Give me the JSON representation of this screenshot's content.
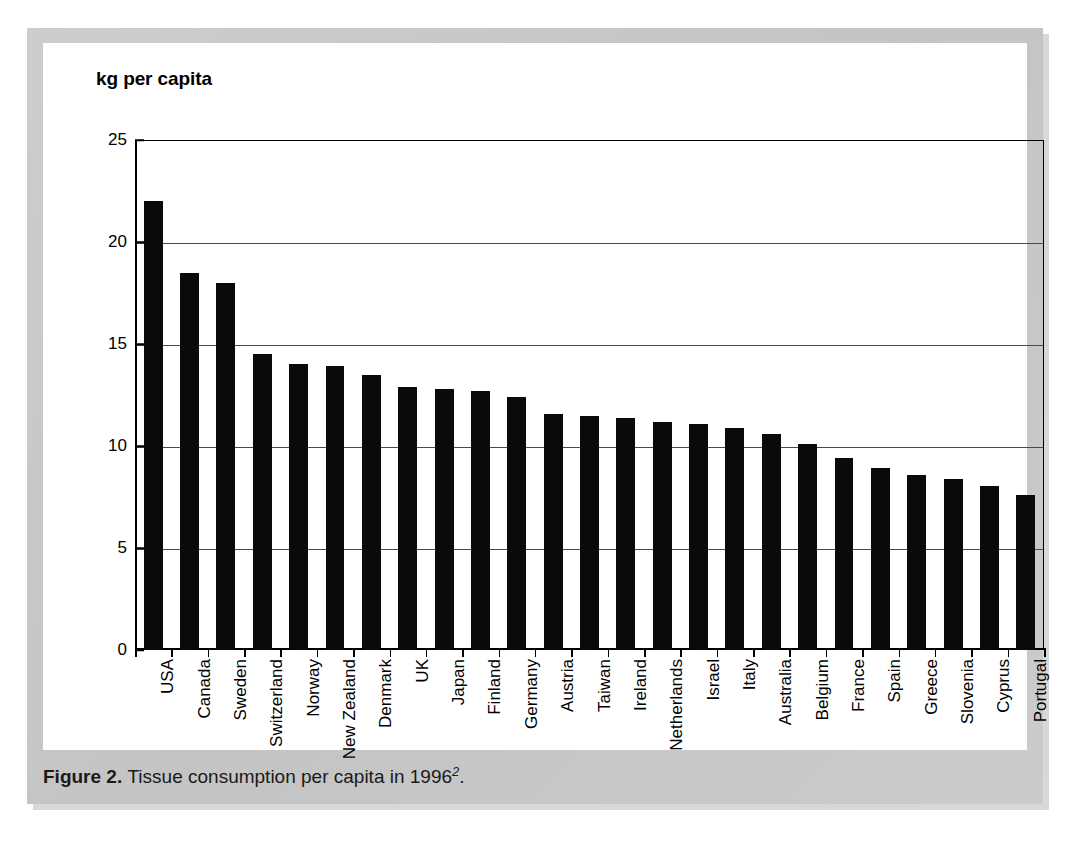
{
  "figure": {
    "axis_title": "kg per capita",
    "caption_label": "Figure 2.",
    "caption_text": "Tissue consumption per capita in 1996",
    "caption_superscript": "2",
    "caption_end": ".",
    "frame_color": "#c8c8c8",
    "panel_color": "#ffffff",
    "bar_color": "#0a0a0a",
    "grid_color": "#4a4a4a",
    "axis_color": "#000000"
  },
  "chart_data": {
    "type": "bar",
    "title": "",
    "subtitle": "",
    "xlabel": "",
    "ylabel": "kg per capita",
    "ylim": [
      0,
      25
    ],
    "yticks": [
      0,
      5,
      10,
      15,
      20,
      25
    ],
    "ytick_labels": [
      "0",
      "5",
      "10",
      "15",
      "20",
      "25"
    ],
    "grid": true,
    "grid_axis": "y",
    "legend": false,
    "legend_position": "none",
    "orientation": "vertical",
    "categories": [
      "USA",
      "Canada",
      "Sweden",
      "Switzerland",
      "Norway",
      "New Zealand",
      "Denmark",
      "UK",
      "Japan",
      "Finland",
      "Germany",
      "Austria",
      "Taiwan",
      "Ireland",
      "Netherlands",
      "Israel",
      "Italy",
      "Australia",
      "Belgium",
      "France",
      "Spain",
      "Greece",
      "Slovenia",
      "Cyprus",
      "Portugal"
    ],
    "values": [
      22.0,
      18.5,
      18.0,
      14.5,
      14.0,
      13.9,
      13.5,
      12.9,
      12.8,
      12.7,
      12.4,
      11.55,
      11.45,
      11.35,
      11.2,
      11.1,
      10.9,
      10.6,
      10.1,
      9.4,
      8.9,
      8.6,
      8.4,
      8.05,
      7.6
    ],
    "units": "kg per capita",
    "year": "1996"
  }
}
